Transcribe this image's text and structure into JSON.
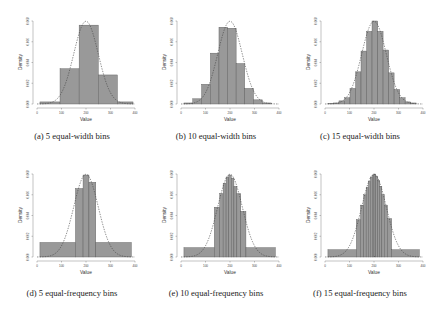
{
  "figure": {
    "captions": [
      "(a)  5 equal-width bins",
      "(b)  10 equal-width bins",
      "(c)  15 equal-width bins",
      "(d)  5 equal-frequency bins",
      "(e)  10 equal-frequency bins",
      "(f)  15 equal-frequency bins"
    ],
    "xlabel": "Value",
    "ylabel": "Density",
    "colors": {
      "bar_fill": "#999999",
      "bar_stroke": "#555555",
      "curve": "#444444",
      "axis": "#666666"
    }
  },
  "chart_data": [
    {
      "type": "bar",
      "title": "(a) 5 equal-width bins",
      "xlabel": "Value",
      "ylabel": "Density",
      "xlim": [
        0,
        400
      ],
      "ylim": [
        0,
        0.008
      ],
      "xticks": [
        0,
        100,
        200,
        300,
        400
      ],
      "yticks": [
        "0.000",
        "0.002",
        "0.004",
        "0.006",
        "0.008"
      ],
      "bins": [
        [
          12,
          94
        ],
        [
          94,
          172
        ],
        [
          172,
          250
        ],
        [
          250,
          328
        ],
        [
          328,
          392
        ]
      ],
      "values": [
        0.0002,
        0.0034,
        0.0076,
        0.0028,
        0.0002
      ],
      "overlay": {
        "type": "normal_density",
        "mean": 200,
        "sd": 50,
        "style": "dashed"
      }
    },
    {
      "type": "bar",
      "title": "(b) 10 equal-width bins",
      "xlabel": "Value",
      "ylabel": "Density",
      "xlim": [
        0,
        400
      ],
      "ylim": [
        0,
        0.008
      ],
      "xticks": [
        0,
        100,
        200,
        300,
        400
      ],
      "yticks": [
        "0.000",
        "0.002",
        "0.004",
        "0.006",
        "0.008"
      ],
      "bins": [
        [
          12,
          48
        ],
        [
          48,
          84
        ],
        [
          84,
          120
        ],
        [
          120,
          155
        ],
        [
          155,
          190
        ],
        [
          190,
          225
        ],
        [
          225,
          260
        ],
        [
          260,
          296
        ],
        [
          296,
          332
        ],
        [
          332,
          370
        ]
      ],
      "values": [
        0.0001,
        0.0005,
        0.0019,
        0.0049,
        0.0074,
        0.0073,
        0.0039,
        0.0015,
        0.0004,
        0.0001
      ],
      "overlay": {
        "type": "normal_density",
        "mean": 200,
        "sd": 50,
        "style": "dashed"
      }
    },
    {
      "type": "bar",
      "title": "(c) 15 equal-width bins",
      "xlabel": "Value",
      "ylabel": "Density",
      "xlim": [
        0,
        400
      ],
      "ylim": [
        0,
        0.008
      ],
      "xticks": [
        0,
        100,
        200,
        300,
        400
      ],
      "yticks": [
        "0.000",
        "0.002",
        "0.004",
        "0.006",
        "0.008"
      ],
      "bins": [
        [
          12,
          35
        ],
        [
          35,
          57
        ],
        [
          57,
          80
        ],
        [
          80,
          102
        ],
        [
          102,
          125
        ],
        [
          125,
          147
        ],
        [
          147,
          170
        ],
        [
          170,
          192
        ],
        [
          192,
          215
        ],
        [
          215,
          237
        ],
        [
          237,
          260
        ],
        [
          260,
          282
        ],
        [
          282,
          305
        ],
        [
          305,
          327
        ],
        [
          327,
          350
        ],
        [
          350,
          372
        ]
      ],
      "values": [
        5e-05,
        0.0001,
        0.0003,
        0.0006,
        0.0015,
        0.0031,
        0.0051,
        0.007,
        0.008,
        0.007,
        0.0052,
        0.003,
        0.0014,
        0.0006,
        0.0002,
        0.0001
      ],
      "overlay": {
        "type": "normal_density",
        "mean": 200,
        "sd": 50,
        "style": "dashed"
      }
    },
    {
      "type": "bar",
      "title": "(d) 5 equal-frequency bins",
      "xlabel": "Value",
      "ylabel": "Density",
      "xlim": [
        0,
        400
      ],
      "ylim": [
        0,
        0.008
      ],
      "xticks": [
        0,
        100,
        200,
        300,
        400
      ],
      "yticks": [
        "0.000",
        "0.002",
        "0.004",
        "0.006",
        "0.008"
      ],
      "bins": [
        [
          12,
          157
        ],
        [
          157,
          188
        ],
        [
          188,
          212
        ],
        [
          212,
          240
        ],
        [
          240,
          385
        ]
      ],
      "values": [
        0.0014,
        0.0066,
        0.0079,
        0.0072,
        0.0014
      ],
      "overlay": {
        "type": "normal_density",
        "mean": 200,
        "sd": 50,
        "style": "dashed"
      }
    },
    {
      "type": "bar",
      "title": "(e) 10 equal-frequency bins",
      "xlabel": "Value",
      "ylabel": "Density",
      "xlim": [
        0,
        400
      ],
      "ylim": [
        0,
        0.008
      ],
      "xticks": [
        0,
        100,
        200,
        300,
        400
      ],
      "yticks": [
        "0.000",
        "0.002",
        "0.004",
        "0.006",
        "0.008"
      ],
      "bins": [
        [
          12,
          136
        ],
        [
          136,
          158
        ],
        [
          158,
          172
        ],
        [
          172,
          184
        ],
        [
          184,
          195
        ],
        [
          195,
          205
        ],
        [
          205,
          216
        ],
        [
          216,
          228
        ],
        [
          228,
          244
        ],
        [
          244,
          265
        ],
        [
          265,
          385
        ]
      ],
      "values": [
        0.0009,
        0.0048,
        0.0061,
        0.0071,
        0.0077,
        0.0079,
        0.0076,
        0.0068,
        0.0061,
        0.0044,
        0.0009
      ],
      "overlay": {
        "type": "normal_density",
        "mean": 200,
        "sd": 50,
        "style": "dashed"
      }
    },
    {
      "type": "bar",
      "title": "(f) 15 equal-frequency bins",
      "xlabel": "Value",
      "ylabel": "Density",
      "xlim": [
        0,
        400
      ],
      "ylim": [
        0,
        0.008
      ],
      "xticks": [
        0,
        100,
        200,
        300,
        400
      ],
      "yticks": [
        "0.000",
        "0.002",
        "0.004",
        "0.006",
        "0.008"
      ],
      "bins": [
        [
          12,
          128
        ],
        [
          128,
          145
        ],
        [
          145,
          158
        ],
        [
          158,
          168
        ],
        [
          168,
          177
        ],
        [
          177,
          185
        ],
        [
          185,
          193
        ],
        [
          193,
          200
        ],
        [
          200,
          207
        ],
        [
          207,
          215
        ],
        [
          215,
          223
        ],
        [
          223,
          232
        ],
        [
          232,
          242
        ],
        [
          242,
          255
        ],
        [
          255,
          272
        ],
        [
          272,
          385
        ]
      ],
      "values": [
        0.0007,
        0.0036,
        0.005,
        0.006,
        0.0067,
        0.0073,
        0.0077,
        0.0079,
        0.008,
        0.0078,
        0.0074,
        0.0068,
        0.006,
        0.005,
        0.0037,
        0.0007
      ],
      "overlay": {
        "type": "normal_density",
        "mean": 200,
        "sd": 50,
        "style": "dashed"
      }
    }
  ]
}
